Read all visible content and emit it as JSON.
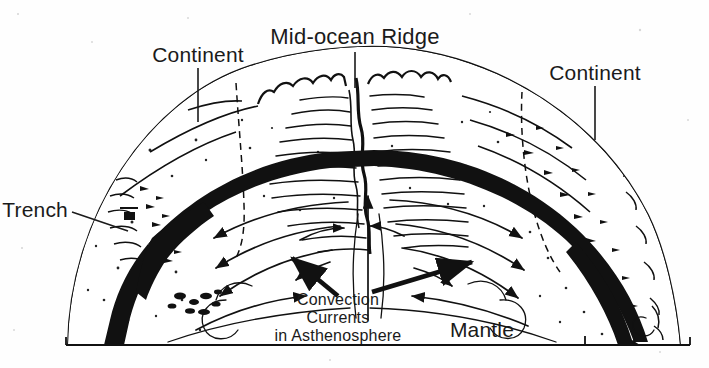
{
  "figure": {
    "title_visible": "Mid-ocean Ridge",
    "type": "cross-section diagram",
    "style": "black and white line art with stippling"
  },
  "labels": {
    "mid_ocean_ridge": "Mid-ocean Ridge",
    "continent_left": "Continent",
    "continent_right": "Continent",
    "trench": "Trench",
    "mantle": "Mantle",
    "convection_line1": "Convection",
    "convection_line2": "Currents",
    "convection_line3": "in Asthenosphere"
  },
  "colors": {
    "ink": "#111111",
    "background": "#fefefe",
    "crust_fill": "#ffffff",
    "slab_fill": "#111111"
  },
  "features": {
    "ridge_crest": "scalloped double crest with central rift valley",
    "spreading_center": "upwelling arrow rising at ridge axis",
    "left_trench": "subduction trench with descending black slab",
    "right_trench": "subduction zone with descending black slab",
    "convection_cells": "two counter-rotating cells beneath lithosphere",
    "lithosphere_band": "thick black arc beneath crust"
  },
  "annotations": {
    "leader_ridge": "vertical leader from title to ridge crest",
    "leader_continent_left": "vertical leader to left continental crust",
    "leader_continent_right": "vertical leader to right continental crust",
    "leader_trench": "diagonal leader to trench notch",
    "pointer_left": "thick arrow pointing up-left into left convection cell",
    "pointer_right": "thick arrow pointing up-right into right convection cell"
  }
}
